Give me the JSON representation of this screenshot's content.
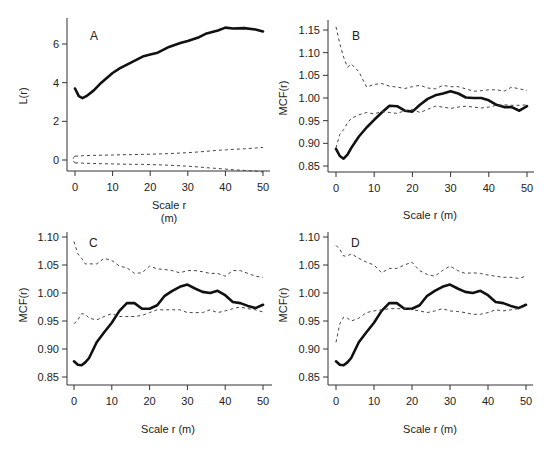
{
  "chart_data": [
    {
      "panel": "A",
      "type": "line",
      "title": "A",
      "xlabel": "Scale r (m)",
      "ylabel": "L(r)",
      "xticks": [
        0,
        10,
        20,
        30,
        40,
        50
      ],
      "yticks": [
        0,
        2,
        4,
        6
      ],
      "xlim": [
        0,
        50
      ],
      "ylim": [
        -0.6,
        7.2
      ],
      "grid": false,
      "x": [
        0,
        1,
        2,
        3,
        5,
        7,
        10,
        12,
        15,
        18,
        20,
        22,
        25,
        28,
        30,
        33,
        35,
        38,
        40,
        42,
        45,
        48,
        50
      ],
      "series": [
        {
          "name": "observed",
          "style": "solid-thick",
          "values": [
            3.7,
            3.3,
            3.2,
            3.3,
            3.6,
            4.0,
            4.5,
            4.75,
            5.05,
            5.35,
            5.45,
            5.55,
            5.85,
            6.05,
            6.15,
            6.35,
            6.55,
            6.7,
            6.85,
            6.8,
            6.82,
            6.75,
            6.65
          ]
        },
        {
          "name": "upper envelope",
          "style": "dashed",
          "values": [
            0.2,
            0.2,
            0.22,
            0.23,
            0.24,
            0.25,
            0.26,
            0.27,
            0.28,
            0.29,
            0.3,
            0.31,
            0.33,
            0.36,
            0.38,
            0.42,
            0.45,
            0.5,
            0.52,
            0.55,
            0.58,
            0.62,
            0.65
          ]
        },
        {
          "name": "lower envelope",
          "style": "dashed",
          "values": [
            -0.15,
            -0.15,
            -0.16,
            -0.17,
            -0.18,
            -0.19,
            -0.2,
            -0.21,
            -0.22,
            -0.23,
            -0.24,
            -0.25,
            -0.27,
            -0.3,
            -0.32,
            -0.36,
            -0.4,
            -0.44,
            -0.47,
            -0.5,
            -0.54,
            -0.58,
            -0.62
          ]
        }
      ]
    },
    {
      "panel": "B",
      "type": "line",
      "title": "B",
      "xlabel": "Scale r (m)",
      "ylabel": "MCF(r)",
      "xticks": [
        0,
        10,
        20,
        30,
        40,
        50
      ],
      "yticks": [
        0.85,
        0.9,
        0.95,
        1.0,
        1.05,
        1.1,
        1.15
      ],
      "xlim": [
        0,
        50
      ],
      "ylim": [
        0.85,
        1.16
      ],
      "grid": false,
      "x": [
        0,
        1,
        2,
        3,
        4,
        6,
        8,
        10,
        12,
        14,
        16,
        18,
        20,
        22,
        24,
        26,
        28,
        30,
        32,
        34,
        36,
        38,
        40,
        42,
        44,
        46,
        48,
        50
      ],
      "series": [
        {
          "name": "observed",
          "style": "solid-thick",
          "values": [
            0.888,
            0.872,
            0.866,
            0.875,
            0.89,
            0.915,
            0.935,
            0.952,
            0.968,
            0.983,
            0.982,
            0.972,
            0.97,
            0.985,
            0.998,
            1.006,
            1.01,
            1.015,
            1.01,
            1.001,
            1.0,
            1.0,
            0.995,
            0.985,
            0.98,
            0.98,
            0.972,
            0.982
          ]
        },
        {
          "name": "upper envelope",
          "style": "dashed",
          "values": [
            1.157,
            1.12,
            1.09,
            1.068,
            1.075,
            1.058,
            1.024,
            1.03,
            1.032,
            1.026,
            1.024,
            1.021,
            1.025,
            1.028,
            1.022,
            1.02,
            1.028,
            1.025,
            1.025,
            1.02,
            1.015,
            1.016,
            1.018,
            1.018,
            1.015,
            1.024,
            1.02,
            1.017
          ]
        },
        {
          "name": "lower envelope",
          "style": "dashed",
          "values": [
            0.89,
            0.92,
            0.93,
            0.945,
            0.955,
            0.963,
            0.968,
            0.965,
            0.97,
            0.968,
            0.966,
            0.972,
            0.975,
            0.968,
            0.975,
            0.982,
            0.98,
            0.977,
            0.98,
            0.982,
            0.98,
            0.978,
            0.98,
            0.984,
            0.985,
            0.984,
            0.984,
            0.985
          ]
        }
      ]
    },
    {
      "panel": "C",
      "type": "line",
      "title": "C",
      "xlabel": "Scale r (m)",
      "ylabel": "MCF(r)",
      "xticks": [
        0,
        10,
        20,
        30,
        40,
        50
      ],
      "yticks": [
        0.85,
        0.9,
        0.95,
        1.0,
        1.05,
        1.1
      ],
      "xlim": [
        0,
        50
      ],
      "ylim": [
        0.85,
        1.1
      ],
      "grid": false,
      "x": [
        0,
        1,
        2,
        3,
        4,
        6,
        8,
        10,
        12,
        14,
        16,
        18,
        20,
        22,
        24,
        26,
        28,
        30,
        32,
        34,
        36,
        38,
        40,
        42,
        44,
        46,
        48,
        50
      ],
      "series": [
        {
          "name": "observed",
          "style": "solid-thick",
          "values": [
            0.878,
            0.872,
            0.871,
            0.876,
            0.884,
            0.912,
            0.93,
            0.947,
            0.968,
            0.982,
            0.982,
            0.972,
            0.972,
            0.978,
            0.995,
            1.004,
            1.011,
            1.015,
            1.008,
            1.002,
            1.0,
            1.004,
            0.996,
            0.984,
            0.982,
            0.977,
            0.973,
            0.979
          ]
        },
        {
          "name": "upper envelope",
          "style": "dashed",
          "values": [
            1.092,
            1.07,
            1.062,
            1.052,
            1.052,
            1.052,
            1.062,
            1.058,
            1.048,
            1.045,
            1.035,
            1.036,
            1.048,
            1.043,
            1.042,
            1.04,
            1.036,
            1.04,
            1.04,
            1.038,
            1.035,
            1.035,
            1.03,
            1.04,
            1.04,
            1.035,
            1.03,
            1.028
          ]
        },
        {
          "name": "lower envelope",
          "style": "dashed",
          "values": [
            0.945,
            0.952,
            0.963,
            0.962,
            0.955,
            0.952,
            0.958,
            0.963,
            0.958,
            0.958,
            0.958,
            0.96,
            0.965,
            0.97,
            0.97,
            0.97,
            0.97,
            0.965,
            0.965,
            0.965,
            0.97,
            0.965,
            0.968,
            0.972,
            0.975,
            0.972,
            0.97,
            0.966
          ]
        }
      ]
    },
    {
      "panel": "D",
      "type": "line",
      "title": "D",
      "xlabel": "Scale r (m)",
      "ylabel": "MCF(r)",
      "xticks": [
        0,
        10,
        20,
        30,
        40,
        50
      ],
      "yticks": [
        0.85,
        0.9,
        0.95,
        1.0,
        1.05,
        1.1
      ],
      "xlim": [
        0,
        50
      ],
      "ylim": [
        0.85,
        1.1
      ],
      "grid": false,
      "x": [
        0,
        1,
        2,
        3,
        4,
        6,
        8,
        10,
        12,
        14,
        16,
        18,
        20,
        22,
        24,
        26,
        28,
        30,
        32,
        34,
        36,
        38,
        40,
        42,
        44,
        46,
        48,
        50
      ],
      "series": [
        {
          "name": "observed",
          "style": "solid-thick",
          "values": [
            0.878,
            0.872,
            0.871,
            0.876,
            0.884,
            0.912,
            0.93,
            0.947,
            0.968,
            0.982,
            0.982,
            0.972,
            0.972,
            0.978,
            0.995,
            1.004,
            1.011,
            1.015,
            1.008,
            1.002,
            1.0,
            1.004,
            0.996,
            0.984,
            0.982,
            0.977,
            0.973,
            0.979
          ]
        },
        {
          "name": "upper envelope",
          "style": "dashed",
          "values": [
            1.085,
            1.078,
            1.066,
            1.066,
            1.07,
            1.062,
            1.055,
            1.05,
            1.036,
            1.044,
            1.044,
            1.05,
            1.055,
            1.04,
            1.033,
            1.03,
            1.04,
            1.048,
            1.04,
            1.035,
            1.036,
            1.035,
            1.032,
            1.03,
            1.028,
            1.028,
            1.026,
            1.03
          ]
        },
        {
          "name": "lower envelope",
          "style": "dashed",
          "values": [
            0.912,
            0.945,
            0.957,
            0.955,
            0.95,
            0.955,
            0.965,
            0.968,
            0.97,
            0.972,
            0.972,
            0.972,
            0.97,
            0.968,
            0.965,
            0.968,
            0.972,
            0.968,
            0.967,
            0.965,
            0.962,
            0.962,
            0.965,
            0.97,
            0.968,
            0.97,
            0.972,
            0.976
          ]
        }
      ]
    }
  ],
  "labels": {
    "panelA": {
      "letter": "A",
      "ylabel": "L(r)",
      "xlabel_line1": "Scale r",
      "xlabel_line2": "(m)"
    },
    "panelB": {
      "letter": "B",
      "ylabel": "MCF(r)",
      "xlabel": "Scale r (m)"
    },
    "panelC": {
      "letter": "C",
      "ylabel": "MCF(r)",
      "xlabel": "Scale r (m)"
    },
    "panelD": {
      "letter": "D",
      "ylabel": "MCF(r)",
      "xlabel": "Scale r (m)"
    }
  }
}
